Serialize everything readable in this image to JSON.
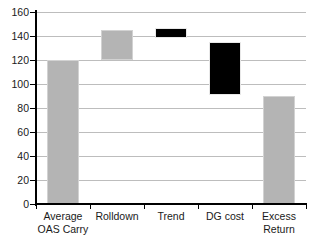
{
  "chart_data": {
    "type": "bar",
    "title": "",
    "subtitle": "",
    "xlabel": "",
    "ylabel": "",
    "ylim": [
      0,
      160
    ],
    "yticks": [
      0,
      20,
      40,
      60,
      80,
      100,
      120,
      140,
      160
    ],
    "ytick_labels": [
      "0",
      "20",
      "40",
      "60",
      "80",
      "100",
      "120",
      "140",
      "160"
    ],
    "grid": "horizontal",
    "legend": "none",
    "waterfall": true,
    "categories": [
      "Average OAS Carry",
      "Rolldown",
      "Trend",
      "DG cost",
      "Excess Return"
    ],
    "category_lines": [
      [
        "Average",
        "OAS Carry"
      ],
      [
        "Rolldown",
        ""
      ],
      [
        "Trend",
        ""
      ],
      [
        "DG cost",
        ""
      ],
      [
        "Excess",
        "Return"
      ]
    ],
    "series": [
      {
        "name": "Waterfall bars",
        "bars": [
          {
            "label": "Average OAS Carry",
            "base": 0,
            "top": 120,
            "value": 120,
            "color": "#b4b4b4",
            "style": "gray"
          },
          {
            "label": "Rolldown",
            "base": 120,
            "top": 145,
            "value": 25,
            "color": "#b4b4b4",
            "style": "gray"
          },
          {
            "label": "Trend",
            "base": 138,
            "top": 147,
            "value": 9,
            "color": "#000000",
            "style": "black"
          },
          {
            "label": "DG cost",
            "base": 91,
            "top": 135,
            "value": -44,
            "color": "#000000",
            "style": "black"
          },
          {
            "label": "Excess Return",
            "base": 0,
            "top": 90,
            "value": 90,
            "color": "#b4b4b4",
            "style": "gray"
          }
        ]
      }
    ],
    "colors": {
      "positive_bar": "#b4b4b4",
      "negative_bar": "#000000",
      "gridline": "#bdbdbd",
      "axis": "#000000",
      "text": "#1a1a1a",
      "background": "#ffffff"
    }
  }
}
